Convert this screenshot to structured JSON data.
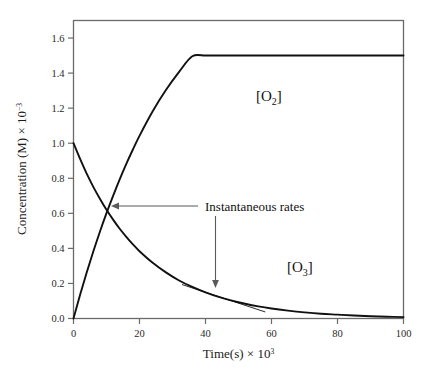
{
  "figure": {
    "background_color": "#ffffff",
    "frame_color": "#555555",
    "curve_color": "#111111"
  },
  "axes": {
    "x": {
      "title_main": "Time(s) × 10",
      "title_exponent": "3",
      "tick_labels": [
        "0",
        "20",
        "40",
        "60",
        "80",
        "100"
      ],
      "tick_values": [
        0,
        20,
        40,
        60,
        80,
        100
      ],
      "min": 0,
      "max": 100
    },
    "y": {
      "title_main": "Concentration (M) × 10",
      "title_exponent": "−3",
      "tick_labels": [
        "0.0",
        "0.2",
        "0.4",
        "0.6",
        "0.8",
        "1.0",
        "1.2",
        "1.4",
        "1.6"
      ],
      "tick_values": [
        0.0,
        0.2,
        0.4,
        0.6,
        0.8,
        1.0,
        1.2,
        1.4,
        1.6
      ],
      "min": 0.0,
      "max": 1.7
    }
  },
  "labels": {
    "o2": "[O₂]",
    "o2_base": "[O",
    "o2_sub": "2",
    "o2_close": "]",
    "o3": "[O₃]",
    "o3_base": "[O",
    "o3_sub": "3",
    "o3_close": "]",
    "annotation": "Instantaneous rates"
  },
  "chart_data": {
    "type": "line",
    "title": "",
    "xlabel": "Time(s) × 10^3",
    "ylabel": "Concentration (M) × 10^-3",
    "xlim": [
      0,
      100
    ],
    "ylim": [
      0,
      1.7
    ],
    "grid": false,
    "legend_position": "inline-labels",
    "annotations": [
      {
        "text": "Instantaneous rates",
        "points_to": "crossing-point",
        "arrow": "left",
        "target_x": 10,
        "target_y": 0.6
      },
      {
        "text": "",
        "points_to": "o3-tangent",
        "arrow": "down",
        "target_x": 46,
        "target_y": 0.12
      }
    ],
    "series": [
      {
        "name": "[O2]",
        "label_position": {
          "x": 47,
          "y": 1.29
        },
        "x": [
          0,
          2,
          4,
          6,
          8,
          10,
          12,
          14,
          16,
          18,
          20,
          24,
          28,
          32,
          36,
          40,
          44,
          48,
          52,
          56,
          60,
          65,
          70,
          75,
          80,
          85,
          90,
          95,
          100
        ],
        "y": [
          0.0,
          0.135,
          0.262,
          0.382,
          0.495,
          0.601,
          0.7,
          0.794,
          0.882,
          0.964,
          1.042,
          1.182,
          1.303,
          1.407,
          1.496,
          1.5,
          1.5,
          1.5,
          1.5,
          1.5,
          1.5,
          1.5,
          1.5,
          1.5,
          1.5,
          1.5,
          1.5,
          1.5,
          1.5
        ]
      },
      {
        "name": "[O3]",
        "label_position": {
          "x": 56,
          "y": 0.255
        },
        "x": [
          0,
          2,
          4,
          6,
          8,
          10,
          12,
          14,
          16,
          18,
          20,
          24,
          28,
          32,
          36,
          40,
          44,
          48,
          52,
          56,
          60,
          65,
          70,
          75,
          80,
          85,
          90,
          95,
          100
        ],
        "y": [
          1.0,
          0.91,
          0.826,
          0.751,
          0.683,
          0.62,
          0.564,
          0.512,
          0.466,
          0.423,
          0.384,
          0.318,
          0.263,
          0.217,
          0.18,
          0.149,
          0.123,
          0.102,
          0.084,
          0.069,
          0.057,
          0.045,
          0.035,
          0.027,
          0.022,
          0.017,
          0.013,
          0.01,
          0.008
        ]
      },
      {
        "name": "tangent-o3",
        "tangent": true,
        "x": [
          33,
          58
        ],
        "y": [
          0.193,
          0.038
        ]
      }
    ]
  }
}
